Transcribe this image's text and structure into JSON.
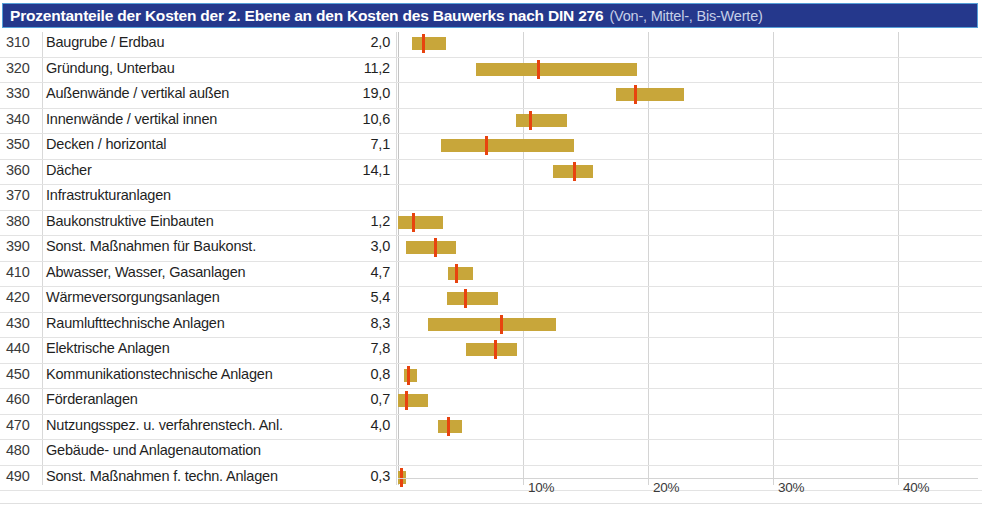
{
  "header": {
    "title_main": "Prozentanteile der Kosten der 2. Ebene an den Kosten des Bauwerks nach DIN 276",
    "title_sub": "(Von-, Mittel-, Bis-Werte)",
    "bg_color": "#25388c",
    "text_color": "#ffffff",
    "sub_text_color": "#c5cfe8"
  },
  "colors": {
    "bar": "#c8a63a",
    "marker": "#e8430f",
    "gridline": "#d4d4d4",
    "rowline": "#e3e3e3"
  },
  "chart_data": {
    "type": "bar",
    "title": "Prozentanteile der Kosten der 2. Ebene an den Kosten des Bauwerks nach DIN 276 (Von-, Mittel-, Bis-Werte)",
    "xlabel": "",
    "ylabel": "",
    "xlim": [
      0,
      46.4
    ],
    "grid": true,
    "legend": "none",
    "xticks": [
      10,
      20,
      30,
      40
    ],
    "xticklabels": [
      "10%",
      "20%",
      "30%",
      "40%"
    ],
    "value_format": "german-decimal-comma",
    "series_note": "Each row is a von-bis range bar with a red mittel (mean) marker; the printed number is the Mittel-Wert.",
    "categories": [
      "310 Baugrube / Erdbau",
      "320 Gründung, Unterbau",
      "330 Außenwände / vertikal außen",
      "340 Innenwände / vertikal innen",
      "350 Decken / horizontal",
      "360 Dächer",
      "370 Infrastrukturanlagen",
      "380 Baukonstruktive Einbauten",
      "390 Sonst. Maßnahmen für Baukonst.",
      "410 Abwasser, Wasser, Gasanlagen",
      "420 Wärmeversorgungsanlagen",
      "430 Raumlufttechnische Anlagen",
      "440 Elektrische Anlagen",
      "450 Kommunikationstechnische Anlagen",
      "460 Förderanlagen",
      "470 Nutzungsspez. u. verfahrenstech. Anl.",
      "480 Gebäude- und Anlagenautomation",
      "490 Sonst. Maßnahmen f. techn. Anlagen"
    ],
    "values": [
      2.0,
      11.2,
      19.0,
      10.6,
      7.1,
      14.1,
      null,
      1.2,
      3.0,
      4.7,
      5.4,
      8.3,
      7.8,
      0.8,
      0.7,
      4.0,
      null,
      0.3
    ],
    "von": [
      1.1,
      6.2,
      17.4,
      9.4,
      3.4,
      12.4,
      null,
      0.0,
      0.6,
      4.0,
      3.9,
      2.4,
      5.4,
      0.5,
      0.0,
      3.2,
      null,
      0.0
    ],
    "bis": [
      3.8,
      19.1,
      22.9,
      13.5,
      14.1,
      15.6,
      null,
      3.6,
      4.6,
      6.0,
      8.0,
      12.6,
      9.5,
      1.5,
      2.4,
      5.1,
      null,
      0.6
    ]
  },
  "table": {
    "rows": [
      {
        "code": "310",
        "label": "Baugrube / Erdbau",
        "value": "2,0"
      },
      {
        "code": "320",
        "label": "Gründung, Unterbau",
        "value": "11,2"
      },
      {
        "code": "330",
        "label": "Außenwände / vertikal außen",
        "value": "19,0"
      },
      {
        "code": "340",
        "label": "Innenwände / vertikal innen",
        "value": "10,6"
      },
      {
        "code": "350",
        "label": "Decken / horizontal",
        "value": "7,1"
      },
      {
        "code": "360",
        "label": "Dächer",
        "value": "14,1"
      },
      {
        "code": "370",
        "label": "Infrastrukturanlagen",
        "value": ""
      },
      {
        "code": "380",
        "label": "Baukonstruktive Einbauten",
        "value": "1,2"
      },
      {
        "code": "390",
        "label": "Sonst. Maßnahmen für Baukonst.",
        "value": "3,0"
      },
      {
        "code": "410",
        "label": "Abwasser, Wasser, Gasanlagen",
        "value": "4,7"
      },
      {
        "code": "420",
        "label": "Wärmeversorgungsanlagen",
        "value": "5,4"
      },
      {
        "code": "430",
        "label": "Raumlufttechnische Anlagen",
        "value": "8,3"
      },
      {
        "code": "440",
        "label": "Elektrische Anlagen",
        "value": "7,8"
      },
      {
        "code": "450",
        "label": "Kommunikationstechnische Anlagen",
        "value": "0,8"
      },
      {
        "code": "460",
        "label": "Förderanlagen",
        "value": "0,7"
      },
      {
        "code": "470",
        "label": "Nutzungsspez. u. verfahrenstech. Anl.",
        "value": "4,0"
      },
      {
        "code": "480",
        "label": "Gebäude- und Anlagenautomation",
        "value": ""
      },
      {
        "code": "490",
        "label": "Sonst. Maßnahmen f. techn. Anlagen",
        "value": "0,3"
      }
    ]
  },
  "axis": {
    "ticks": [
      {
        "label": "10%",
        "value": 10
      },
      {
        "label": "20%",
        "value": 20
      },
      {
        "label": "30%",
        "value": 30
      },
      {
        "label": "40%",
        "value": 40
      }
    ]
  }
}
